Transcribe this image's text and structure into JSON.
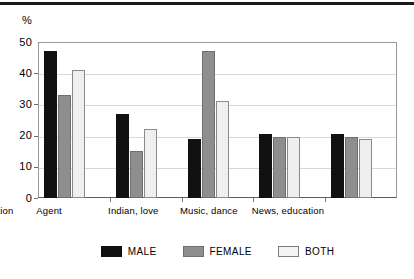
{
  "chart_data": {
    "type": "bar",
    "title": "",
    "subtitle": "",
    "xlabel": "",
    "ylabel": "%",
    "ylim": [
      0,
      50
    ],
    "yticks": [
      0,
      10,
      20,
      30,
      40,
      50
    ],
    "ytick_labels": [
      "0",
      "10",
      "20",
      "30",
      "40",
      "50"
    ],
    "grid": "horizontal gridlines at 10, 20, 30, 40",
    "legend_position": "bottom-center",
    "categories": [
      "War, action",
      "Agent",
      "Indian, love",
      "Music, dance",
      "News, education"
    ],
    "series": [
      {
        "name": "MALE",
        "color": "#111111",
        "values": [
          47,
          27,
          19,
          20.5,
          20.5
        ]
      },
      {
        "name": "FEMALE",
        "color": "#8e8e8e",
        "values": [
          33,
          15,
          47,
          19.5,
          19.5
        ]
      },
      {
        "name": "BOTH",
        "color": "#efefef",
        "values": [
          41,
          22,
          31,
          19.5,
          19
        ]
      }
    ]
  },
  "axis": {
    "unit_label": "%"
  },
  "legend": {
    "items": [
      {
        "label": "MALE",
        "swatch": "black-square-swatch"
      },
      {
        "label": "FEMALE",
        "swatch": "gray-square-swatch"
      },
      {
        "label": "BOTH",
        "swatch": "white-square-swatch"
      }
    ]
  }
}
